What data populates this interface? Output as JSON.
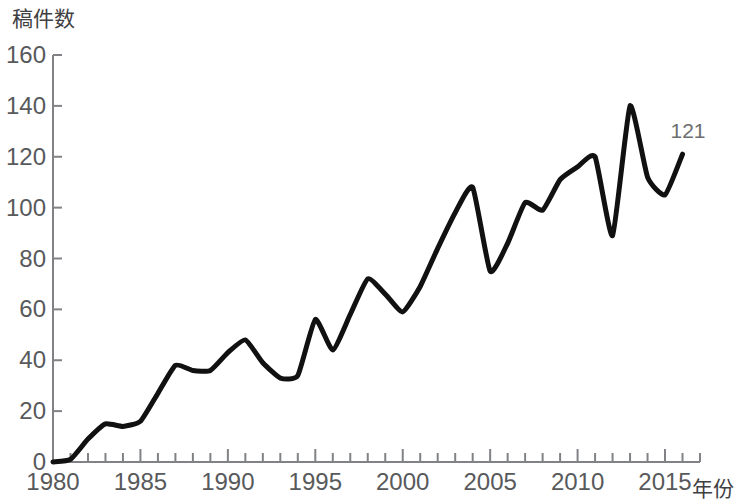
{
  "chart_data": {
    "type": "line",
    "title": "",
    "ylabel": "稿件数",
    "xlabel": "年份",
    "xlim": [
      1980,
      2017
    ],
    "ylim": [
      0,
      160
    ],
    "grid": false,
    "legend": null,
    "y_ticks": [
      0,
      20,
      40,
      60,
      80,
      100,
      120,
      140,
      160
    ],
    "y_tick_labels": [
      "0",
      "20",
      "40",
      "60",
      "80",
      "100",
      "120",
      "140",
      "160"
    ],
    "x_ticks": [
      1980,
      1985,
      1990,
      1995,
      2000,
      2005,
      2010,
      2015
    ],
    "x_tick_labels": [
      "1980",
      "1985",
      "1990",
      "1995",
      "2000",
      "2005",
      "2010",
      "2015"
    ],
    "x_minor_tick_step": 1,
    "line_color": "#111111",
    "line_width": 5,
    "annotations": [
      {
        "text": "121",
        "x": 2016,
        "y": 121
      }
    ],
    "x": [
      1980,
      1981,
      1982,
      1983,
      1984,
      1985,
      1986,
      1987,
      1988,
      1989,
      1990,
      1991,
      1992,
      1993,
      1994,
      1995,
      1996,
      1997,
      1998,
      1999,
      2000,
      2001,
      2002,
      2003,
      2004,
      2005,
      2006,
      2007,
      2008,
      2009,
      2010,
      2011,
      2012,
      2013,
      2014,
      2015,
      2016
    ],
    "values": [
      0,
      1,
      9,
      15,
      14,
      16,
      27,
      38,
      36,
      36,
      43,
      48,
      39,
      33,
      34,
      56,
      44,
      58,
      72,
      66,
      59,
      69,
      84,
      98,
      108,
      75,
      86,
      102,
      99,
      111,
      116,
      120,
      89,
      140,
      112,
      105,
      121
    ]
  }
}
